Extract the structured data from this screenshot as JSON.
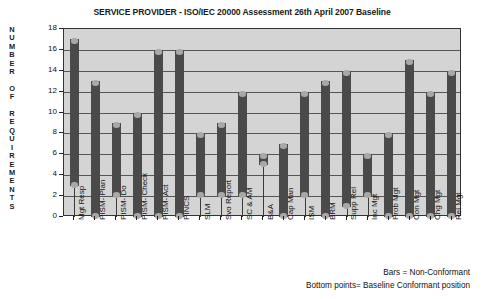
{
  "chart_data": {
    "type": "bar",
    "title": "SERVICE PROVIDER - ISO/IEC 20000 Assessment 26th April 2007 Baseline",
    "xlabel": "",
    "ylabel": "NUMBER OF REQUIREMENTS",
    "ylim": [
      0,
      18
    ],
    "yticks": [
      0,
      2,
      4,
      6,
      8,
      10,
      12,
      14,
      16,
      18
    ],
    "grid": true,
    "legend_position": "below-right",
    "categories": [
      "Mgt Resp",
      "PISM- Plan",
      "PISM- Do",
      "PISM- Check",
      "PISM- Act",
      "PINCS",
      "SLM",
      "Svo Report",
      "SC & AM",
      "B&A",
      "Cap Man",
      "ISM",
      "BRM",
      "Supp Rel",
      "Inc Mgt",
      "Prob Mgt",
      "Con Mgt",
      "Chg Mgt",
      "Rel Mgt"
    ],
    "series": [
      {
        "name": "Non-Conformant",
        "values": [
          17,
          13,
          9,
          10,
          16,
          16,
          8,
          9,
          12,
          6,
          7,
          12,
          13,
          14,
          6,
          8,
          15,
          12,
          14
        ]
      },
      {
        "name": "Baseline Conformant position",
        "values": [
          3,
          0,
          2,
          0,
          0,
          0,
          2,
          2,
          2,
          5,
          0,
          2,
          0,
          1,
          2,
          0,
          0,
          0,
          0
        ]
      }
    ],
    "annotations": [
      "Bars = Non-Conformant",
      "Bottom points= Baseline Conformant position"
    ],
    "colors": {
      "bar": "#4a4a4a",
      "marker": "#a8a8a8",
      "plot_background": "#d4d4d4",
      "grid": "#555555",
      "axis": "#333333"
    }
  },
  "notes": {
    "bars": "Bars = Non-Conformant",
    "points": "Bottom points= Baseline Conformant position"
  },
  "ylabel_letters": [
    "N",
    "U",
    "M",
    "B",
    "E",
    "R",
    "",
    "O",
    "F",
    "",
    "R",
    "E",
    "Q",
    "U",
    "I",
    "R",
    "E",
    "M",
    "E",
    "N",
    "T",
    "S"
  ]
}
